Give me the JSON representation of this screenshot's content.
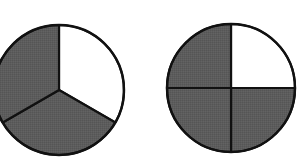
{
  "diagram": {
    "title": "",
    "colors": {
      "shaded": "#5c5c5c",
      "unshaded": "#ffffff",
      "stroke": "#111111"
    },
    "figures": [
      {
        "name": "circle-thirds",
        "parts": 3,
        "shaded_parts": 2,
        "fraction": "2/3",
        "cx": 59,
        "cy": 90,
        "r": 65,
        "sectors": [
          {
            "start_deg": -90,
            "end_deg": 30,
            "shaded": false
          },
          {
            "start_deg": 30,
            "end_deg": 150,
            "shaded": true
          },
          {
            "start_deg": 150,
            "end_deg": 270,
            "shaded": true
          }
        ]
      },
      {
        "name": "circle-quarters",
        "parts": 4,
        "shaded_parts": 3,
        "fraction": "3/4",
        "cx": 231,
        "cy": 88,
        "r": 64,
        "sectors": [
          {
            "start_deg": -90,
            "end_deg": 0,
            "shaded": false
          },
          {
            "start_deg": 0,
            "end_deg": 90,
            "shaded": true
          },
          {
            "start_deg": 90,
            "end_deg": 180,
            "shaded": true
          },
          {
            "start_deg": 180,
            "end_deg": 270,
            "shaded": true
          }
        ]
      }
    ]
  }
}
